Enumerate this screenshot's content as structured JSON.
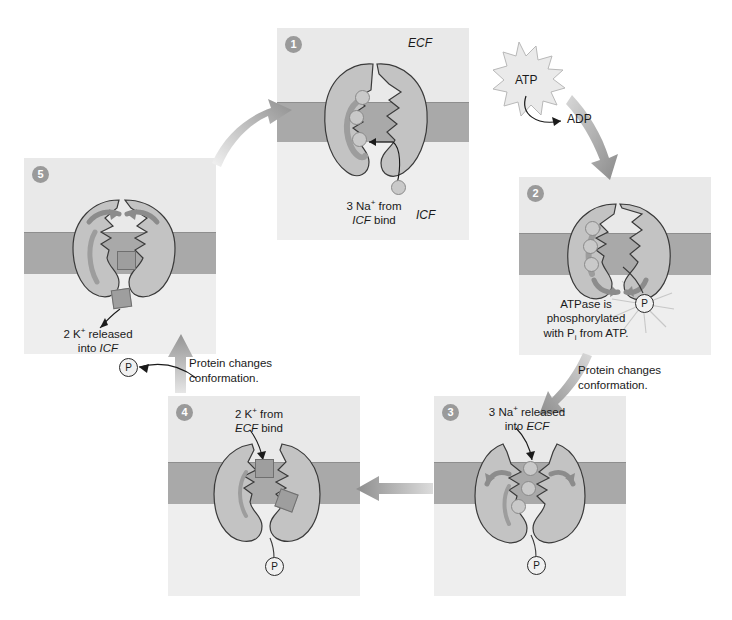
{
  "diagram": {
    "background_color": "#ffffff",
    "panel_color": "#e9e9e9",
    "membrane_color": "#a9a9a9",
    "badge_color": "#9a9a9a",
    "na_ion_color": "#c9c9c9",
    "k_ion_color": "#9e9e9e",
    "arrow_color": "#9b9b9b"
  },
  "panels": [
    {
      "number": "1",
      "fluid_top": "ECF",
      "fluid_bottom": "ICF",
      "caption_line1_pre": "3 Na",
      "caption_line1_sup": "+",
      "caption_line1_post": " from",
      "caption_line2_ital": "ICF",
      "caption_line2_post": " bind",
      "na_count": 3,
      "loose_na_count": 1
    },
    {
      "number": "2",
      "caption_line1": "ATPase is",
      "caption_line2": "phosphorylated",
      "caption_line3_pre": "with P",
      "caption_line3_sub": "i",
      "caption_line3_post": " from ATP.",
      "na_count": 3,
      "phosphate_label": "P"
    },
    {
      "number": "3",
      "caption_line1_pre": "3 Na",
      "caption_line1_sup": "+",
      "caption_line1_post": " released",
      "caption_line2_pre": "into ",
      "caption_line2_ital": "ECF",
      "na_count": 3,
      "phosphate_label": "P"
    },
    {
      "number": "4",
      "caption_line1_pre": "2 K",
      "caption_line1_sup": "+",
      "caption_line1_post": " from",
      "caption_line2_ital": "ECF",
      "caption_line2_post": " bind",
      "k_count": 2,
      "phosphate_label": "P"
    },
    {
      "number": "5",
      "caption_line1_pre": "2 K",
      "caption_line1_sup": "+",
      "caption_line1_post": " released",
      "caption_line2_pre": "into ",
      "caption_line2_ital": "ICF",
      "k_count": 2
    }
  ],
  "annotations": {
    "atp": "ATP",
    "adp": "ADP",
    "conformation_right_line1": "Protein changes",
    "conformation_right_line2": "conformation.",
    "conformation_left_line1": "Protein changes",
    "conformation_left_line2": "conformation.",
    "released_phosphate": "P"
  }
}
